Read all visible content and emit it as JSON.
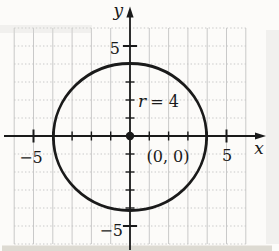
{
  "figure": {
    "y_axis_label": "y",
    "x_axis_label": "x",
    "y_max_label": "5",
    "y_min_label": "−5",
    "x_min_label": "−5",
    "x_max_label": "5",
    "radius_var": "r",
    "radius_eq": "= 4",
    "center_label": "(0, 0)",
    "circle": {
      "center_x": 0,
      "center_y": 0,
      "radius": 4
    },
    "axes": {
      "x_tick_min": -5,
      "x_tick_max": 5,
      "y_tick_min": -5,
      "y_tick_max": 5,
      "grid_min": -6,
      "grid_max": 6
    },
    "colors": {
      "ink": "#1a1a1a",
      "grid": "#c3c3c3",
      "paper": "#fcfbf9",
      "page_edge": "#ccc8bd"
    }
  }
}
